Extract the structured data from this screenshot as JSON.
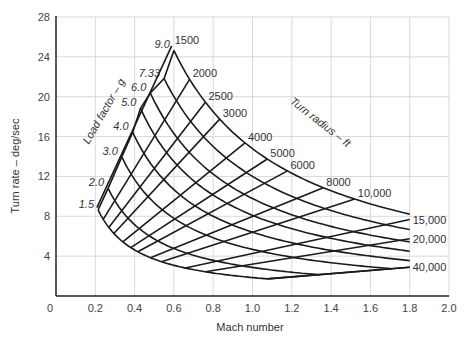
{
  "chart_data": {
    "type": "line",
    "title": "",
    "xlabel": "Mach number",
    "ylabel": "Turn rate – deg/sec",
    "xlim": [
      0,
      2.0
    ],
    "ylim": [
      0,
      28
    ],
    "x_ticks": [
      "0",
      "0.2",
      "0.4",
      "0.6",
      "0.8",
      "1.0",
      "1.2",
      "1.4",
      "1.6",
      "1.8",
      "2.0"
    ],
    "y_ticks": [
      "4",
      "8",
      "12",
      "16",
      "20",
      "24",
      "28"
    ],
    "grid": true,
    "family_labels": {
      "load_factor": "Load factor – g",
      "turn_radius": "Turn radius – ft"
    },
    "load_factor_series": [
      {
        "name": "9.0",
        "n": 9.0,
        "m_start": 0.6
      },
      {
        "name": "7.33",
        "n": 7.33,
        "m_start": 0.55
      },
      {
        "name": "6.0",
        "n": 6.0,
        "m_start": 0.48
      },
      {
        "name": "5.0",
        "n": 5.0,
        "m_start": 0.43
      },
      {
        "name": "4.0",
        "n": 4.0,
        "m_start": 0.39
      },
      {
        "name": "3.0",
        "n": 3.0,
        "m_start": 0.335
      },
      {
        "name": "2.0",
        "n": 2.0,
        "m_start": 0.265
      },
      {
        "name": "1.5",
        "n": 1.5,
        "m_start": 0.214
      }
    ],
    "turn_radius_series": [
      {
        "name": "1500",
        "radius_ft": 1500
      },
      {
        "name": "2000",
        "radius_ft": 2000
      },
      {
        "name": "2500",
        "radius_ft": 2500
      },
      {
        "name": "3000",
        "radius_ft": 3000
      },
      {
        "name": "4000",
        "radius_ft": 4000
      },
      {
        "name": "5000",
        "radius_ft": 5000
      },
      {
        "name": "6000",
        "radius_ft": 6000
      },
      {
        "name": "8000",
        "radius_ft": 8000
      },
      {
        "name": "10,000",
        "radius_ft": 10000
      },
      {
        "name": "15,000",
        "radius_ft": 15000
      },
      {
        "name": "20,000",
        "radius_ft": 20000
      },
      {
        "name": "40,000",
        "radius_ft": 40000
      }
    ],
    "key_points": [
      {
        "label": "n=9.0 / R=1500 apex",
        "mach": 0.6,
        "turn_rate": 25.2
      },
      {
        "label": "n=1.5 left end",
        "mach": 0.21,
        "turn_rate": 8.6
      },
      {
        "label": "R=40,000 at M1.8",
        "mach": 1.8,
        "turn_rate": 2.9
      },
      {
        "label": "R=20,000 at M1.8",
        "mach": 1.8,
        "turn_rate": 5.8
      },
      {
        "label": "R=15,000 at M1.8",
        "mach": 1.8,
        "turn_rate": 7.7
      },
      {
        "label": "n=9.0 at M1.8",
        "mach": 1.8,
        "turn_rate": 8.2
      }
    ],
    "m_max": 1.8
  }
}
